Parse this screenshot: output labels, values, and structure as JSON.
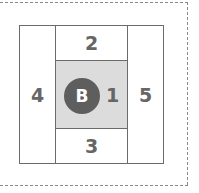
{
  "diagram": {
    "regions": {
      "top": "2",
      "bottom": "3",
      "left": "4",
      "right": "5",
      "center": "1"
    },
    "marker": "B"
  }
}
